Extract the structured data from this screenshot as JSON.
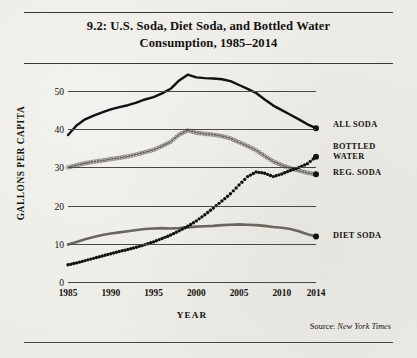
{
  "figure": {
    "title": "9.2: U.S. Soda, Diet Soda, and Bottled Water Consumption, 1985–2014",
    "title_line1": "9.2: U.S. Soda, Diet Soda, and Bottled Water",
    "title_line2": "Consumption, 1985–2014",
    "source_prefix": "Source:",
    "source_name": "New York Times"
  },
  "legend": {
    "all_soda": "ALL SODA",
    "bottled_water_line1": "BOTTLED",
    "bottled_water_line2": "WATER",
    "reg_soda": "REG. SODA",
    "diet_soda": "DIET SODA"
  },
  "axes": {
    "ylabel": "GALLONS PER CAPITA",
    "xlabel": "YEAR",
    "yticks": [
      "0",
      "10",
      "20",
      "30",
      "40",
      "50"
    ],
    "xticks": [
      "1985",
      "1990",
      "1995",
      "2000",
      "2005",
      "2010",
      "2014"
    ]
  },
  "colors": {
    "paper": "#ecebe5",
    "ink": "#14120f",
    "rule": "#3b3933",
    "all_soda": "#111111",
    "reg_soda": "#6d6a63",
    "diet_soda": "#6a6760",
    "bottled_water": "#111111"
  },
  "chart_data": {
    "type": "line",
    "title": "9.2: U.S. Soda, Diet Soda, and Bottled Water Consumption, 1985–2014",
    "xlabel": "YEAR",
    "ylabel": "GALLONS PER CAPITA",
    "xlim": [
      1985,
      2014
    ],
    "ylim": [
      0,
      55
    ],
    "yticks": [
      0,
      10,
      20,
      30,
      40,
      50
    ],
    "xticks": [
      1985,
      1990,
      1995,
      2000,
      2005,
      2010,
      2014
    ],
    "grid": "horizontal",
    "legend_position": "right-inline-labels",
    "x": [
      1985,
      1986,
      1987,
      1988,
      1989,
      1990,
      1991,
      1992,
      1993,
      1994,
      1995,
      1996,
      1997,
      1998,
      1999,
      2000,
      2001,
      2002,
      2003,
      2004,
      2005,
      2006,
      2007,
      2008,
      2009,
      2010,
      2011,
      2012,
      2013,
      2014
    ],
    "series": [
      {
        "name": "ALL SODA",
        "marker": "none",
        "style": "solid-thick",
        "values": [
          38.5,
          41.0,
          42.6,
          43.6,
          44.4,
          45.2,
          45.8,
          46.3,
          47.0,
          47.8,
          48.4,
          49.4,
          50.6,
          52.8,
          54.3,
          53.6,
          53.4,
          53.3,
          53.1,
          52.6,
          51.6,
          50.6,
          49.5,
          47.8,
          46.2,
          45.0,
          43.8,
          42.6,
          41.3,
          40.3
        ]
      },
      {
        "name": "REG. SODA",
        "marker": "circle-open",
        "style": "dotted-markers",
        "values": [
          30.0,
          30.6,
          31.1,
          31.5,
          31.8,
          32.2,
          32.5,
          32.9,
          33.4,
          34.0,
          34.6,
          35.6,
          36.7,
          38.6,
          39.7,
          39.1,
          38.8,
          38.6,
          38.2,
          37.6,
          36.6,
          35.6,
          34.5,
          33.0,
          31.6,
          30.6,
          29.8,
          29.2,
          28.6,
          28.2
        ]
      },
      {
        "name": "DIET SODA",
        "marker": "none",
        "style": "solid-thick-grey",
        "values": [
          9.8,
          10.5,
          11.2,
          11.8,
          12.3,
          12.7,
          13.0,
          13.3,
          13.6,
          13.9,
          14.0,
          14.1,
          14.0,
          14.1,
          14.3,
          14.5,
          14.6,
          14.7,
          14.9,
          15.0,
          15.1,
          15.0,
          14.9,
          14.7,
          14.4,
          14.2,
          13.9,
          13.3,
          12.5,
          11.9
        ]
      },
      {
        "name": "BOTTLED WATER",
        "marker": "dot-filled",
        "style": "dotted",
        "values": [
          4.5,
          5.0,
          5.6,
          6.2,
          6.8,
          7.4,
          8.0,
          8.5,
          9.1,
          9.8,
          10.5,
          11.4,
          12.3,
          13.4,
          14.6,
          16.0,
          17.6,
          19.4,
          21.2,
          23.1,
          25.4,
          27.6,
          28.8,
          28.5,
          27.6,
          28.3,
          29.2,
          30.0,
          31.0,
          32.8
        ]
      }
    ]
  }
}
